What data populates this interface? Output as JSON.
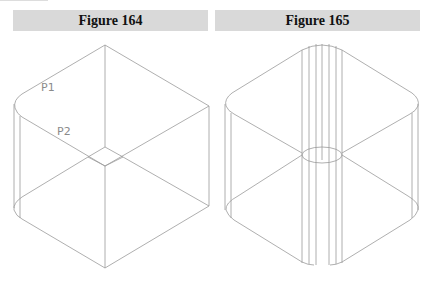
{
  "figures": [
    {
      "caption": "Figure 164",
      "labels": [
        "P1",
        "P2"
      ]
    },
    {
      "caption": "Figure 165",
      "labels": []
    }
  ],
  "colors": {
    "caption_bg": "#d9d9d9",
    "line": "#9a9a9a",
    "label": "#8a8a8a"
  }
}
